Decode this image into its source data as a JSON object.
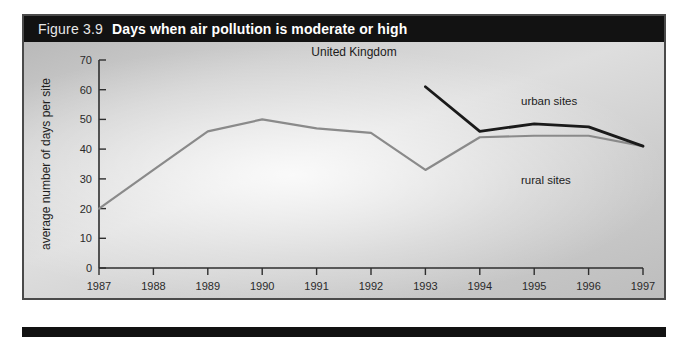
{
  "figure": {
    "number": "Figure 3.9",
    "title": "Days when air pollution is moderate or high"
  },
  "chart_data": {
    "type": "line",
    "title": "Days when air pollution is moderate or high",
    "region_label": "United Kingdom",
    "xlabel": "Year",
    "ylabel": "average number of days per site",
    "source": "Source: DETR",
    "categories": [
      "1987",
      "1988",
      "1989",
      "1990",
      "1991",
      "1992",
      "1993",
      "1994",
      "1995",
      "1996",
      "1997"
    ],
    "xlim": [
      1987,
      1997
    ],
    "ylim": [
      0,
      70
    ],
    "yticks": [
      "0",
      "10",
      "20",
      "30",
      "40",
      "50",
      "60",
      "70"
    ],
    "ytick_values": [
      0,
      10,
      20,
      30,
      40,
      50,
      60,
      70
    ],
    "grid": false,
    "legend_position": "inline-annotations",
    "series": [
      {
        "name": "urban sites",
        "color": "#1a1a1a",
        "x": [
          1993,
          1994,
          1995,
          1996,
          1997
        ],
        "values": [
          61,
          46,
          48.5,
          47.5,
          41
        ]
      },
      {
        "name": "rural sites",
        "color": "#8a8a8a",
        "x": [
          1987,
          1988,
          1989,
          1990,
          1991,
          1992,
          1993,
          1994,
          1995,
          1996,
          1997
        ],
        "values": [
          20,
          33,
          46,
          50,
          47,
          45.5,
          33,
          44,
          44.5,
          44.5,
          41
        ]
      }
    ]
  },
  "colors": {
    "title_bar": "#121212",
    "urban": "#1a1a1a",
    "rural": "#8a8a8a",
    "frame": "#4a4a4a"
  }
}
